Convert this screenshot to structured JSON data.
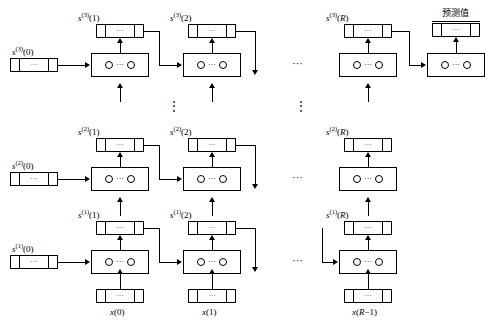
{
  "figure": {
    "type": "stacked-lstm-unrolled-diagram",
    "dots": "···",
    "vdots": "⋮",
    "prediction_label": "预测值",
    "layers": [
      {
        "id": "layer3",
        "state_labels": [
          "s(3)(0)",
          "s(3)(1)",
          "s(3)(2)",
          "s(3)(R)"
        ]
      },
      {
        "id": "layer2",
        "state_labels": [
          "s(2)(0)",
          "s(2)(1)",
          "s(2)(2)",
          "s(2)(R)"
        ]
      },
      {
        "id": "layer1",
        "state_labels": [
          "s(1)(0)",
          "s(1)(1)",
          "s(1)(2)",
          "s(1)(R)"
        ]
      }
    ],
    "inputs": [
      "x(0)",
      "x(1)",
      "x(R−1)"
    ]
  }
}
